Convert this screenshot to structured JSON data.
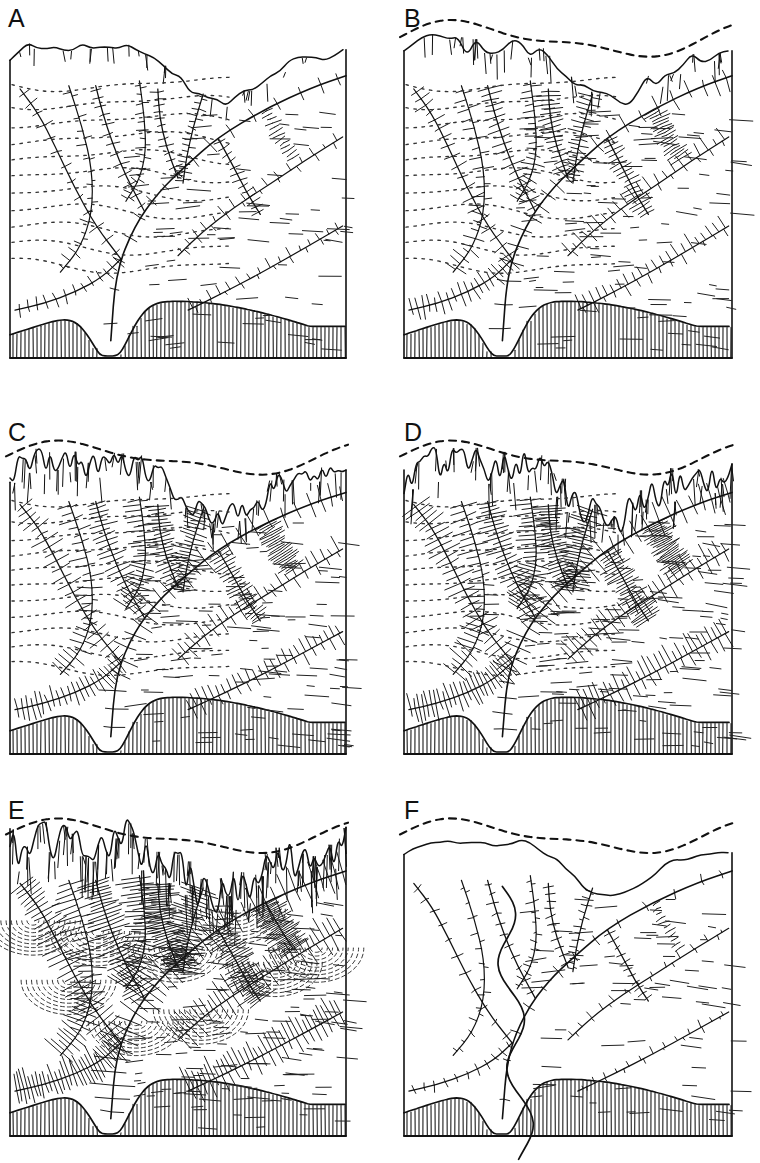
{
  "figure": {
    "background_color": "#ffffff",
    "ink_color": "#000000",
    "width": 760,
    "height": 1163,
    "columns": 2,
    "rows": 3
  },
  "panels": [
    {
      "label": "A",
      "label_x": 8,
      "label_y": 6,
      "frame": {
        "x": 10,
        "y": 28,
        "w": 336,
        "h": 330
      },
      "stage": "initial-dissection",
      "caption_text": "",
      "features": {
        "original_surface_dashed": false,
        "skyline_ruggedness": 0.18,
        "hachure_density": 0.22,
        "contour_dots": true,
        "basement_hatch": true,
        "basement_height": 58,
        "valley_count": 3,
        "cirque_count": 3
      }
    },
    {
      "label": "B",
      "label_x": 404,
      "label_y": 6,
      "frame": {
        "x": 404,
        "y": 28,
        "w": 328,
        "h": 330
      },
      "stage": "early-glacial-erosion",
      "caption_text": "",
      "features": {
        "original_surface_dashed": true,
        "skyline_ruggedness": 0.42,
        "hachure_density": 0.45,
        "contour_dots": true,
        "basement_hatch": true,
        "basement_height": 58,
        "valley_count": 3,
        "cirque_count": 3
      }
    },
    {
      "label": "C",
      "label_x": 8,
      "label_y": 420,
      "frame": {
        "x": 10,
        "y": 448,
        "w": 336,
        "h": 306
      },
      "stage": "advancing-cirque-growth",
      "caption_text": "",
      "features": {
        "original_surface_dashed": true,
        "skyline_ruggedness": 0.62,
        "hachure_density": 0.62,
        "contour_dots": true,
        "basement_hatch": true,
        "basement_height": 58,
        "valley_count": 3,
        "cirque_count": 4
      }
    },
    {
      "label": "D",
      "label_x": 404,
      "label_y": 420,
      "frame": {
        "x": 404,
        "y": 448,
        "w": 328,
        "h": 306
      },
      "stage": "maximum-dissection",
      "caption_text": "",
      "features": {
        "original_surface_dashed": true,
        "skyline_ruggedness": 0.78,
        "hachure_density": 0.78,
        "contour_dots": true,
        "basement_hatch": true,
        "basement_height": 58,
        "valley_count": 4,
        "cirque_count": 4
      }
    },
    {
      "label": "E",
      "label_x": 8,
      "label_y": 798,
      "frame": {
        "x": 10,
        "y": 826,
        "w": 336,
        "h": 310
      },
      "stage": "fully-dissected-alpine",
      "caption_text": "",
      "features": {
        "original_surface_dashed": true,
        "skyline_ruggedness": 1.0,
        "hachure_density": 1.0,
        "contour_dots": false,
        "basement_hatch": true,
        "basement_height": 58,
        "valley_count": 5,
        "cirque_count": 6
      }
    },
    {
      "label": "F",
      "label_x": 404,
      "label_y": 798,
      "frame": {
        "x": 404,
        "y": 826,
        "w": 328,
        "h": 310
      },
      "stage": "subdued-residual-surface",
      "caption_text": "",
      "features": {
        "original_surface_dashed": true,
        "skyline_ruggedness": 0.12,
        "hachure_density": 0.12,
        "contour_dots": false,
        "basement_hatch": true,
        "basement_height": 58,
        "valley_count": 3,
        "cirque_count": 0
      }
    }
  ],
  "legend_semantics": {
    "dashed_line": "former / original land surface before erosion",
    "solid_skyline": "present land surface profile",
    "hachures": "steep eroded slopes and cirque headwalls",
    "dotted_lines": "contours on gentle undissected slopes",
    "vertical_hatch": "bedrock basement shown in cross-section"
  }
}
